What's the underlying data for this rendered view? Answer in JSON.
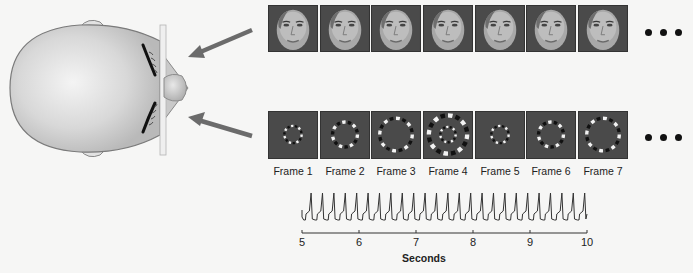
{
  "diagram": {
    "arrows": [
      {
        "from": [
          252,
          30
        ],
        "to": [
          188,
          57
        ],
        "label": ""
      },
      {
        "from": [
          252,
          136
        ],
        "to": [
          188,
          117
        ],
        "label": ""
      }
    ],
    "face_row": {
      "frame_count_visible": 7,
      "continuation": "ellipsis"
    },
    "checkerboard_row": {
      "frames": [
        {
          "label": "Frame 1",
          "ring": "small"
        },
        {
          "label": "Frame 2",
          "ring": "medium"
        },
        {
          "label": "Frame 3",
          "ring": "large"
        },
        {
          "label": "Frame 4",
          "ring": "largest-plus-inner"
        },
        {
          "label": "Frame 5",
          "ring": "small"
        },
        {
          "label": "Frame 6",
          "ring": "medium"
        },
        {
          "label": "Frame 7",
          "ring": "large"
        }
      ],
      "continuation": "ellipsis"
    },
    "timeseries": {
      "axis_title": "Seconds",
      "ticks": [
        "5",
        "6",
        "7",
        "8",
        "9",
        "10"
      ],
      "xlim": [
        5,
        10
      ],
      "approx_peak_count": 25,
      "approx_frequency_hz": 5
    }
  },
  "colors": {
    "background": "#f6f6f5",
    "head_fill": "#d9d9d9",
    "arrow": "#6b6b6b",
    "frame_bg": "#4a4a4a",
    "text": "#222222"
  }
}
